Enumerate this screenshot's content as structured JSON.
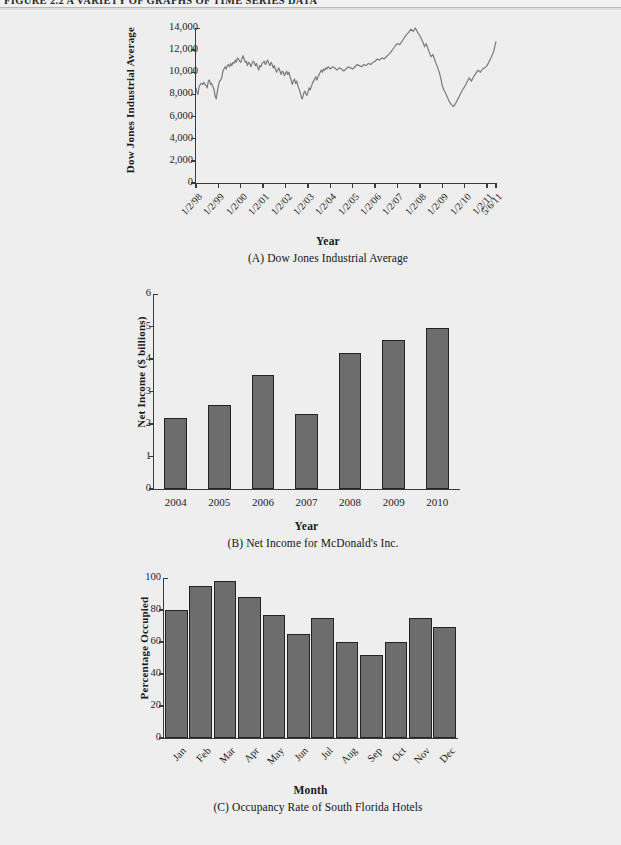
{
  "figure": {
    "running_head": "FIGURE 2.2   A VARIETY OF GRAPHS OF TIME SERIES DATA"
  },
  "chart_data": [
    {
      "id": "A",
      "type": "line",
      "title": "(A) Dow Jones Industrial Average",
      "xlabel": "Year",
      "ylabel": "Dow Jones Industrial Average",
      "ylim": [
        0,
        14000
      ],
      "yticks": [
        0,
        2000,
        4000,
        6000,
        8000,
        10000,
        12000,
        14000
      ],
      "ytick_labels": [
        "0",
        "2,000",
        "4,000",
        "6,000",
        "8,000",
        "10,000",
        "12,000",
        "14,000"
      ],
      "grid": false,
      "legend": "none",
      "xtick_labels": [
        "1/2/98",
        "1/2/99",
        "1/2/00",
        "1/2/01",
        "1/2/02",
        "1/2/03",
        "1/2/04",
        "1/2/05",
        "1/2/06",
        "1/2/07",
        "1/2/08",
        "1/2/09",
        "1/2/10",
        "1/2/11",
        "5/6/11"
      ],
      "line_color": "#7a7a7a",
      "series": [
        {
          "name": "Dow Jones Industrial Average",
          "x": [
            0,
            0.04,
            0.09,
            0.14,
            0.19,
            0.24,
            0.3,
            0.35,
            0.4,
            0.45,
            0.5,
            0.55,
            0.6,
            0.65,
            0.7,
            0.75,
            0.8,
            0.85,
            0.9,
            0.95,
            1.0,
            1.05,
            1.1,
            1.15,
            1.2,
            1.25,
            1.3,
            1.35,
            1.4,
            1.45,
            1.5,
            1.55,
            1.6,
            1.65,
            1.7,
            1.75,
            1.8,
            1.85,
            1.9,
            1.95,
            2.0,
            2.05,
            2.1,
            2.15,
            2.2,
            2.25,
            2.3,
            2.35,
            2.4,
            2.45,
            2.5,
            2.55,
            2.6,
            2.65,
            2.7,
            2.75,
            2.8,
            2.85,
            2.9,
            2.95,
            3.0,
            3.05,
            3.1,
            3.15,
            3.2,
            3.25,
            3.3,
            3.35,
            3.4,
            3.45,
            3.5,
            3.55,
            3.6,
            3.65,
            3.7,
            3.75,
            3.8,
            3.85,
            3.9,
            3.95,
            4.0,
            4.05,
            4.1,
            4.15,
            4.2,
            4.25,
            4.3,
            4.35,
            4.4,
            4.45,
            4.5,
            4.55,
            4.6,
            4.65,
            4.7,
            4.75,
            4.8,
            4.85,
            4.9,
            4.95,
            5.0,
            5.05,
            5.1,
            5.15,
            5.2,
            5.25,
            5.3,
            5.35,
            5.4,
            5.45,
            5.5,
            5.55,
            5.6,
            5.65,
            5.7,
            5.75,
            5.8,
            5.85,
            5.9,
            5.95,
            6.0,
            6.1,
            6.2,
            6.3,
            6.4,
            6.5,
            6.6,
            6.7,
            6.8,
            6.9,
            7.0,
            7.1,
            7.2,
            7.3,
            7.4,
            7.5,
            7.6,
            7.7,
            7.8,
            7.9,
            8.0,
            8.1,
            8.2,
            8.3,
            8.4,
            8.5,
            8.6,
            8.7,
            8.8,
            8.9,
            9.0,
            9.1,
            9.2,
            9.3,
            9.4,
            9.5,
            9.6,
            9.7,
            9.8,
            9.9,
            10.0,
            10.07,
            10.14,
            10.21,
            10.28,
            10.35,
            10.42,
            10.5,
            10.58,
            10.65,
            10.72,
            10.8,
            10.88,
            10.95,
            11.0,
            11.07,
            11.15,
            11.22,
            11.3,
            11.4,
            11.5,
            11.6,
            11.7,
            11.8,
            11.9,
            12.0,
            12.1,
            12.2,
            12.3,
            12.4,
            12.5,
            12.6,
            12.7,
            12.8,
            12.9,
            13.0,
            13.1,
            13.2,
            13.3,
            13.4
          ],
          "y": [
            8600,
            8200,
            8000,
            8700,
            8900,
            9000,
            8900,
            9100,
            8900,
            8800,
            8600,
            9200,
            9300,
            8900,
            9000,
            8700,
            8500,
            7900,
            7600,
            8200,
            8800,
            9200,
            9300,
            9500,
            10100,
            10300,
            10500,
            10300,
            10600,
            10700,
            10500,
            10800,
            10600,
            10900,
            10800,
            11100,
            10900,
            11300,
            11200,
            11000,
            10900,
            11200,
            11500,
            11200,
            10900,
            11000,
            10600,
            10900,
            10800,
            10500,
            10800,
            11000,
            10900,
            10600,
            10800,
            10500,
            10200,
            10600,
            10500,
            10800,
            10900,
            11000,
            10700,
            10900,
            11100,
            10800,
            10600,
            10900,
            10700,
            10400,
            10600,
            10300,
            10000,
            10200,
            10400,
            10100,
            9800,
            10100,
            10000,
            9700,
            9900,
            10100,
            9800,
            10000,
            9600,
            9300,
            8900,
            9200,
            9400,
            9000,
            9200,
            8800,
            8500,
            8200,
            7800,
            7600,
            8000,
            8300,
            8100,
            7900,
            8200,
            8600,
            8400,
            8700,
            9000,
            9200,
            9400,
            9600,
            9300,
            9600,
            9800,
            10000,
            10200,
            10000,
            10300,
            10200,
            10400,
            10300,
            10500,
            10400,
            10300,
            10500,
            10400,
            10200,
            10400,
            10300,
            10100,
            10300,
            10500,
            10400,
            10300,
            10500,
            10700,
            10600,
            10500,
            10700,
            10600,
            10800,
            10700,
            10900,
            11000,
            11200,
            11100,
            11300,
            11200,
            11400,
            11600,
            11800,
            12100,
            12400,
            12600,
            12500,
            12800,
            13100,
            13400,
            13600,
            13900,
            13700,
            14000,
            13600,
            13300,
            13000,
            12700,
            12300,
            12600,
            12200,
            11800,
            11400,
            11600,
            11200,
            10800,
            10400,
            9900,
            9300,
            8800,
            8400,
            8100,
            7800,
            7400,
            7100,
            6900,
            7200,
            7600,
            8000,
            8400,
            8700,
            9100,
            9500,
            9200,
            9600,
            9900,
            10200,
            10000,
            10300,
            10400,
            10600,
            11000,
            11400,
            11900,
            12800
          ]
        }
      ]
    },
    {
      "id": "B",
      "type": "bar",
      "title": "(B) Net Income for McDonald's Inc.",
      "xlabel": "Year",
      "ylabel": "Net Income ($ billions)",
      "ylim": [
        0,
        6
      ],
      "yticks": [
        0,
        1,
        2,
        3,
        4,
        5,
        6
      ],
      "ytick_labels": [
        "0",
        "1",
        "2",
        "3",
        "4",
        "5",
        "6"
      ],
      "grid": false,
      "legend": "none",
      "bar_color": "#6d6d6d",
      "categories": [
        "2004",
        "2005",
        "2006",
        "2007",
        "2008",
        "2009",
        "2010"
      ],
      "values": [
        2.2,
        2.6,
        3.5,
        2.3,
        4.2,
        4.6,
        4.95
      ]
    },
    {
      "id": "C",
      "type": "bar",
      "title": "(C) Occupancy Rate of South Florida Hotels",
      "xlabel": "Month",
      "ylabel": "Percentage Occupied",
      "ylim": [
        0,
        100
      ],
      "yticks": [
        0,
        20,
        40,
        60,
        80,
        100
      ],
      "ytick_labels": [
        "0",
        "20",
        "40",
        "60",
        "80",
        "100"
      ],
      "grid": false,
      "legend": "none",
      "bar_color": "#6d6d6d",
      "categories": [
        "Jan",
        "Feb",
        "Mar",
        "Apr",
        "May",
        "Jun",
        "Jul",
        "Aug",
        "Sep",
        "Oct",
        "Nov",
        "Dec"
      ],
      "values": [
        80,
        95,
        98,
        88,
        77,
        65,
        75,
        60,
        52,
        60,
        75,
        69.5
      ]
    }
  ]
}
